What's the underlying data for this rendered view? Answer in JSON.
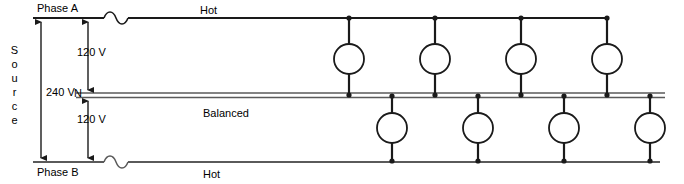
{
  "diagram": {
    "labels": {
      "phase_a": "Phase A",
      "phase_b": "Phase B",
      "hot_top": "Hot",
      "hot_bottom": "Hot",
      "neutral": "N",
      "voltage_total": "240 V",
      "voltage_top": "120 V",
      "voltage_bottom": "120 V",
      "balanced": "Balanced",
      "source_letters": [
        "S",
        "o",
        "u",
        "r",
        "c",
        "e"
      ]
    },
    "colors": {
      "line": "#1a1a1a",
      "neutral_line": "#808080",
      "background": "#ffffff",
      "text": "#000000"
    },
    "geometry": {
      "rail_left_x": 33,
      "rail_right_x": 665,
      "hot_top_y": 18,
      "neutral_y1": 93,
      "neutral_y2": 97,
      "hot_bottom_y": 162,
      "source_arrow_x": 41,
      "tap_arrow_x": 88,
      "break_top_x": 112,
      "break_bottom_x": 112,
      "load_radius": 15
    },
    "loads_top": [
      {
        "name": "load-top-1",
        "x": 349
      },
      {
        "name": "load-top-2",
        "x": 435
      },
      {
        "name": "load-top-3",
        "x": 521
      },
      {
        "name": "load-top-4",
        "x": 607
      }
    ],
    "loads_bottom": [
      {
        "name": "load-bottom-1",
        "x": 392
      },
      {
        "name": "load-bottom-2",
        "x": 478
      },
      {
        "name": "load-bottom-3",
        "x": 564
      },
      {
        "name": "load-bottom-4",
        "x": 650
      }
    ]
  }
}
